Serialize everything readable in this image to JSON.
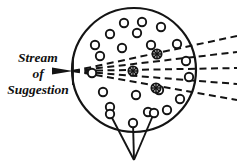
{
  "figure": {
    "width": 237,
    "height": 165,
    "background_color": "#ffffff",
    "ink_color": "#141414"
  },
  "caption": {
    "lines": [
      "Stream",
      "of",
      "Suggestion"
    ],
    "line1": "Stream",
    "line2": "of",
    "line3": "Suggestion",
    "full_text": "Stream of Suggestion",
    "style": "italic-serif-bold",
    "anchor_x": 38,
    "lines_y": [
      62,
      78,
      94
    ]
  },
  "mind_circle": {
    "label": "mind-boundary",
    "cx": 134,
    "cy": 70,
    "r": 62,
    "stroke_width": 2.2,
    "fill": "none",
    "stroke_color": "#141414"
  },
  "entry_point": {
    "label": "stream-entry-point",
    "x": 73,
    "y": 71,
    "arrow_tip_x": 73,
    "arrow_tail_x": 52,
    "arrow_half_height": 3.2
  },
  "rays": {
    "count": 5,
    "style": "dashed",
    "dash_pattern": "7,4.5",
    "stroke_width": 2.0,
    "origin": {
      "x": 73,
      "y": 71
    },
    "endpoints": [
      {
        "id": "ray-1",
        "x": 236,
        "y": 36
      },
      {
        "id": "ray-2",
        "x": 236,
        "y": 52
      },
      {
        "id": "ray-3",
        "x": 236,
        "y": 68
      },
      {
        "id": "ray-4",
        "x": 236,
        "y": 84
      },
      {
        "id": "ray-5",
        "x": 236,
        "y": 100
      }
    ]
  },
  "dormant_ideas": {
    "label": "dormant-idea-circles",
    "count": 20,
    "radius": 4.2,
    "stroke_width": 1.9,
    "fill": "none",
    "positions": [
      {
        "cx": 124,
        "cy": 23
      },
      {
        "cx": 142,
        "cy": 22
      },
      {
        "cx": 161,
        "cy": 27
      },
      {
        "cx": 110,
        "cy": 34
      },
      {
        "cx": 137,
        "cy": 33
      },
      {
        "cx": 177,
        "cy": 44
      },
      {
        "cx": 122,
        "cy": 48
      },
      {
        "cx": 151,
        "cy": 45
      },
      {
        "cx": 100,
        "cy": 56
      },
      {
        "cx": 186,
        "cy": 61
      },
      {
        "cx": 103,
        "cy": 92
      },
      {
        "cx": 136,
        "cy": 95
      },
      {
        "cx": 159,
        "cy": 90
      },
      {
        "cx": 180,
        "cy": 99
      },
      {
        "cx": 110,
        "cy": 107
      },
      {
        "cx": 189,
        "cy": 77
      },
      {
        "cx": 92,
        "cy": 73
      },
      {
        "cx": 167,
        "cy": 110
      },
      {
        "cx": 148,
        "cy": 112
      },
      {
        "cx": 95,
        "cy": 45
      }
    ]
  },
  "activated_ideas": {
    "label": "activated-idea-circles",
    "count": 3,
    "radius": 4.6,
    "stroke_width": 1.9,
    "fill": "#ffffff",
    "hatch": "spoked-star",
    "positions": [
      {
        "cx": 157,
        "cy": 54
      },
      {
        "cx": 133,
        "cy": 71
      },
      {
        "cx": 156,
        "cy": 88
      }
    ]
  },
  "response_stems": {
    "label": "response-stems",
    "count": 3,
    "stroke_width": 1.9,
    "converge_point": {
      "x": 134,
      "y": 160
    },
    "nodes": [
      {
        "cx": 110,
        "cy": 114,
        "r": 4.2
      },
      {
        "cx": 133,
        "cy": 123,
        "r": 4.2
      },
      {
        "cx": 154,
        "cy": 113,
        "r": 4.2
      }
    ]
  }
}
